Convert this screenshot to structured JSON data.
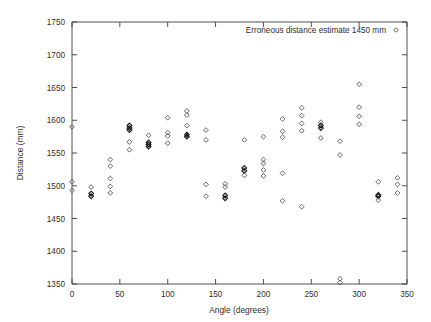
{
  "chart_data": {
    "type": "scatter",
    "title": "",
    "xlabel": "Angle (degrees)",
    "ylabel": "Distance (mm)",
    "xlim": [
      0,
      350
    ],
    "ylim": [
      1350,
      1750
    ],
    "xticks": [
      0,
      50,
      100,
      150,
      200,
      250,
      300,
      350
    ],
    "yticks": [
      1350,
      1400,
      1450,
      1500,
      1550,
      1600,
      1650,
      1700,
      1750
    ],
    "grid": false,
    "legend": {
      "position": "top-right",
      "entries": [
        {
          "label": "Erroneous distance estimate 1450 mm",
          "marker": "open-diamond",
          "color": "#4a4a4a"
        }
      ]
    },
    "series": [
      {
        "name": "Erroneous distance estimate 1450 mm",
        "marker": "open-diamond",
        "color": "#4a4a4a",
        "points": [
          [
            0,
            1590
          ],
          [
            0,
            1506
          ],
          [
            0,
            1493
          ],
          [
            20,
            1498
          ],
          [
            20,
            1488
          ],
          [
            20,
            1484
          ],
          [
            40,
            1540
          ],
          [
            40,
            1530
          ],
          [
            40,
            1511
          ],
          [
            40,
            1499
          ],
          [
            40,
            1489
          ],
          [
            60,
            1592
          ],
          [
            60,
            1588
          ],
          [
            60,
            1585
          ],
          [
            60,
            1567
          ],
          [
            60,
            1555
          ],
          [
            80,
            1577
          ],
          [
            80,
            1566
          ],
          [
            80,
            1563
          ],
          [
            80,
            1560
          ],
          [
            100,
            1604
          ],
          [
            100,
            1581
          ],
          [
            100,
            1576
          ],
          [
            100,
            1565
          ],
          [
            120,
            1614
          ],
          [
            120,
            1608
          ],
          [
            120,
            1592
          ],
          [
            120,
            1578
          ],
          [
            120,
            1575
          ],
          [
            140,
            1585
          ],
          [
            140,
            1570
          ],
          [
            140,
            1502
          ],
          [
            140,
            1484
          ],
          [
            160,
            1503
          ],
          [
            160,
            1498
          ],
          [
            160,
            1485
          ],
          [
            160,
            1481
          ],
          [
            180,
            1570
          ],
          [
            180,
            1527
          ],
          [
            180,
            1523
          ],
          [
            180,
            1516
          ],
          [
            200,
            1575
          ],
          [
            200,
            1540
          ],
          [
            200,
            1534
          ],
          [
            200,
            1524
          ],
          [
            200,
            1515
          ],
          [
            220,
            1602
          ],
          [
            220,
            1583
          ],
          [
            220,
            1574
          ],
          [
            220,
            1519
          ],
          [
            220,
            1477
          ],
          [
            240,
            1619
          ],
          [
            240,
            1607
          ],
          [
            240,
            1595
          ],
          [
            240,
            1584
          ],
          [
            240,
            1468
          ],
          [
            260,
            1597
          ],
          [
            260,
            1592
          ],
          [
            260,
            1588
          ],
          [
            260,
            1573
          ],
          [
            280,
            1568
          ],
          [
            280,
            1547
          ],
          [
            280,
            1358
          ],
          [
            280,
            1352
          ],
          [
            300,
            1655
          ],
          [
            300,
            1620
          ],
          [
            300,
            1606
          ],
          [
            300,
            1594
          ],
          [
            320,
            1506
          ],
          [
            320,
            1486
          ],
          [
            320,
            1484
          ],
          [
            320,
            1478
          ],
          [
            340,
            1512
          ],
          [
            340,
            1502
          ],
          [
            340,
            1489
          ]
        ]
      }
    ]
  }
}
